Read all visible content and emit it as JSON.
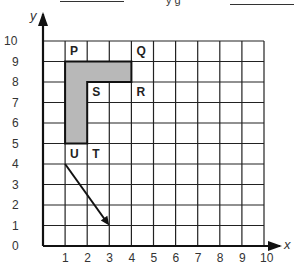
{
  "header": {
    "fragment_text": "y g"
  },
  "chart_data": {
    "type": "grid-diagram",
    "xlabel": "x",
    "ylabel": "y",
    "xlim": [
      0,
      10
    ],
    "ylim": [
      0,
      10
    ],
    "grid": true,
    "x_ticks": [
      "0",
      "1",
      "2",
      "3",
      "4",
      "5",
      "6",
      "7",
      "8",
      "9",
      "10"
    ],
    "y_ticks": [
      "0",
      "1",
      "2",
      "3",
      "4",
      "5",
      "6",
      "7",
      "8",
      "9",
      "10"
    ],
    "points": [
      {
        "label": "P",
        "x": 1,
        "y": 10
      },
      {
        "label": "Q",
        "x": 4,
        "y": 10
      },
      {
        "label": "S",
        "x": 2,
        "y": 8
      },
      {
        "label": "R",
        "x": 4,
        "y": 8
      },
      {
        "label": "U",
        "x": 1,
        "y": 5
      },
      {
        "label": "T",
        "x": 2,
        "y": 5
      }
    ],
    "shaded_shape": {
      "description": "L-shaped region",
      "vertices": [
        [
          1,
          9
        ],
        [
          4,
          9
        ],
        [
          4,
          8
        ],
        [
          2,
          8
        ],
        [
          2,
          5
        ],
        [
          1,
          5
        ]
      ],
      "fill": "#b8b8b8"
    },
    "arrow": {
      "from": [
        1,
        4
      ],
      "to": [
        3,
        1
      ]
    }
  }
}
